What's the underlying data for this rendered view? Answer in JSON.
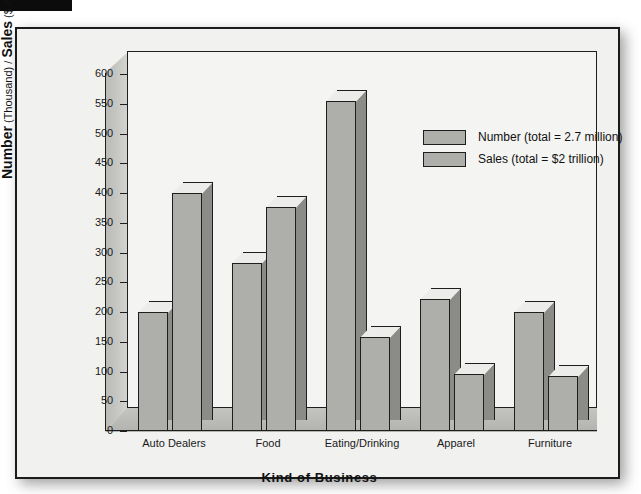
{
  "chart_data": {
    "type": "bar",
    "title": "",
    "xlabel": "Kind of Business",
    "ylabel_bold_1": "Number",
    "ylabel_small_1": " (Thousand) / ",
    "ylabel_bold_2": "Sales",
    "ylabel_small_2": " ($ Billions)",
    "ylabel_full": "Number (Thousand) / Sales ($ Billions)",
    "categories": [
      "Auto Dealers",
      "Food",
      "Eating/Drinking",
      "Apparel",
      "Furniture"
    ],
    "series": [
      {
        "name": "Number (total = 2.7 million)",
        "values": [
          200,
          283,
          555,
          222,
          200
        ]
      },
      {
        "name": "Sales (total = $2 trillion)",
        "values": [
          400,
          377,
          158,
          96,
          92
        ]
      }
    ],
    "ylim": [
      0,
      600
    ],
    "yticks": [
      0,
      50,
      100,
      150,
      200,
      250,
      300,
      350,
      400,
      450,
      500,
      550,
      600
    ],
    "ytick_labels": [
      "0",
      "50",
      "100",
      "150",
      "200",
      "250",
      "300",
      "350",
      "400",
      "450",
      "500",
      "550",
      "600"
    ],
    "grid": false,
    "legend_position": "upper-right",
    "bar_fill_color": "#aeaeaa",
    "bar_side_color": "#8b8b87",
    "bar_top_color": "#ececea",
    "plot_background": "#f4f4f2",
    "frame_background": "#f1f1ef",
    "axis_color": "#1e1e1e"
  },
  "legend": {
    "entries": [
      {
        "label": "Number (total = 2.7 million)"
      },
      {
        "label": "Sales (total = $2 trillion)"
      }
    ]
  }
}
